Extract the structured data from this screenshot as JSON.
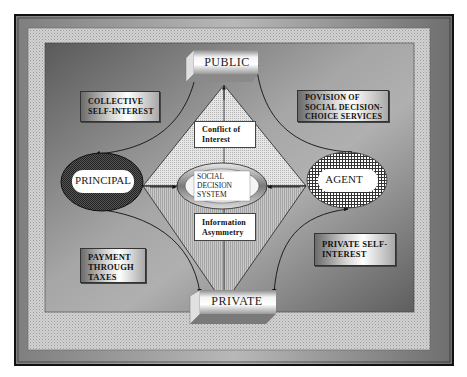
{
  "diagram": {
    "nodes": {
      "public": {
        "label": "PUBLIC"
      },
      "private": {
        "label": "PRIVATE"
      },
      "principal": {
        "label": "PRINCIPAL"
      },
      "agent": {
        "label": "AGENT"
      },
      "social_decision_system": {
        "line1": "SOCIAL",
        "line2": "DECISION",
        "line3": "SYSTEM"
      },
      "conflict_of_interest": {
        "line1": "Conflict of",
        "line2": "Interest"
      },
      "information_asymmetry": {
        "line1": "Information",
        "line2": "Asymmetry"
      }
    },
    "callouts": {
      "collective_self_interest": {
        "line1": "COLLECTIVE",
        "line2": "SELF-INTEREST"
      },
      "provision_services": {
        "line1": "POVISION OF",
        "line2": "SOCIAL DECISION-",
        "line3": "CHOICE SERVICES"
      },
      "payment_through_taxes": {
        "line1": "PAYMENT",
        "line2": "THROUGH",
        "line3": "TAXES"
      },
      "private_self_interest": {
        "line1": "PRIVATE SELF-",
        "line2": "INTEREST"
      }
    },
    "edges": [
      {
        "from": "PRINCIPAL",
        "to": "PUBLIC"
      },
      {
        "from": "AGENT",
        "to": "PUBLIC"
      },
      {
        "from": "PRINCIPAL",
        "to": "PRIVATE"
      },
      {
        "from": "AGENT",
        "to": "PRIVATE"
      },
      {
        "from": "PRINCIPAL",
        "to": "SOCIAL DECISION SYSTEM"
      },
      {
        "from": "AGENT",
        "to": "SOCIAL DECISION SYSTEM"
      },
      {
        "from": "SOCIAL DECISION SYSTEM",
        "to": "PUBLIC"
      },
      {
        "from": "SOCIAL DECISION SYSTEM",
        "to": "PRIVATE"
      }
    ],
    "colors": {
      "outer_frame": "#8a8a8a",
      "dotted_band": "#c4c4c4",
      "inner_panel": "#7a7a7a",
      "border": "#111111"
    }
  }
}
